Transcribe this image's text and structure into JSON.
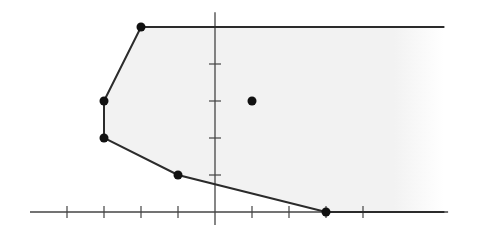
{
  "diagram": {
    "type": "polyhedron-feasible-region",
    "unit_px": 37,
    "origin_px": [
      215,
      212
    ],
    "axes": {
      "x_range": [
        -5,
        6.3
      ],
      "y_range": [
        -0.35,
        5.4
      ],
      "x_ticks": [
        -4,
        -3,
        -2,
        -1,
        1,
        2,
        3,
        4
      ],
      "y_ticks": [
        1,
        2,
        3,
        4
      ]
    },
    "region_vertices": [
      [
        -2,
        5
      ],
      [
        -3,
        3
      ],
      [
        -3,
        2
      ],
      [
        -1,
        1
      ],
      [
        3,
        0
      ]
    ],
    "region_rays": [
      {
        "from": [
          -2,
          5
        ],
        "direction": [
          1,
          0
        ],
        "to_x": 6.2
      },
      {
        "from": [
          3,
          0
        ],
        "direction": [
          1,
          0
        ],
        "to_x": 6.2
      }
    ],
    "interior_point": [
      1,
      3
    ],
    "colors": {
      "line": "#2b2b2b",
      "fill": "#f2f2f2",
      "axis": "#444444",
      "point": "#111111"
    }
  }
}
